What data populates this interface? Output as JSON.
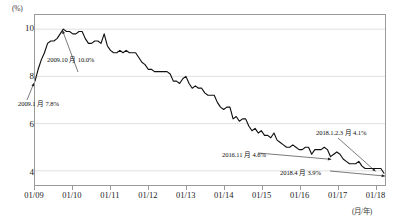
{
  "chart_data": {
    "type": "line",
    "title": "",
    "xlabel": "(月/年)",
    "ylabel": "(%)",
    "ylim": [
      3.4,
      10.6
    ],
    "yticks": [
      10,
      8,
      6,
      4
    ],
    "grid": true,
    "legend": "none",
    "xtick_labels": [
      "01/09",
      "01/10",
      "01/11",
      "01/12",
      "01/13",
      "01/14",
      "01/15",
      "01/16",
      "01/17",
      "01/18"
    ],
    "x_start": "2009-01",
    "x_end": "2018-04",
    "series": [
      {
        "name": "失業率",
        "color": "#111111",
        "x": [
          "2009-01",
          "2009-02",
          "2009-03",
          "2009-04",
          "2009-05",
          "2009-06",
          "2009-07",
          "2009-08",
          "2009-09",
          "2009-10",
          "2009-11",
          "2009-12",
          "2010-01",
          "2010-02",
          "2010-03",
          "2010-04",
          "2010-05",
          "2010-06",
          "2010-07",
          "2010-08",
          "2010-09",
          "2010-10",
          "2010-11",
          "2010-12",
          "2011-01",
          "2011-02",
          "2011-03",
          "2011-04",
          "2011-05",
          "2011-06",
          "2011-07",
          "2011-08",
          "2011-09",
          "2011-10",
          "2011-11",
          "2011-12",
          "2012-01",
          "2012-02",
          "2012-03",
          "2012-04",
          "2012-05",
          "2012-06",
          "2012-07",
          "2012-08",
          "2012-09",
          "2012-10",
          "2012-11",
          "2012-12",
          "2013-01",
          "2013-02",
          "2013-03",
          "2013-04",
          "2013-05",
          "2013-06",
          "2013-07",
          "2013-08",
          "2013-09",
          "2013-10",
          "2013-11",
          "2013-12",
          "2014-01",
          "2014-02",
          "2014-03",
          "2014-04",
          "2014-05",
          "2014-06",
          "2014-07",
          "2014-08",
          "2014-09",
          "2014-10",
          "2014-11",
          "2014-12",
          "2015-01",
          "2015-02",
          "2015-03",
          "2015-04",
          "2015-05",
          "2015-06",
          "2015-07",
          "2015-08",
          "2015-09",
          "2015-10",
          "2015-11",
          "2015-12",
          "2016-01",
          "2016-02",
          "2016-03",
          "2016-04",
          "2016-05",
          "2016-06",
          "2016-07",
          "2016-08",
          "2016-09",
          "2016-10",
          "2016-11",
          "2016-12",
          "2017-01",
          "2017-02",
          "2017-03",
          "2017-04",
          "2017-05",
          "2017-06",
          "2017-07",
          "2017-08",
          "2017-09",
          "2017-10",
          "2017-11",
          "2017-12",
          "2018-01",
          "2018-02",
          "2018-03",
          "2018-04"
        ],
        "values": [
          7.8,
          8.3,
          8.7,
          9.0,
          9.4,
          9.5,
          9.5,
          9.6,
          9.8,
          10.0,
          9.9,
          9.9,
          9.8,
          9.8,
          9.9,
          9.9,
          9.6,
          9.4,
          9.4,
          9.5,
          9.5,
          9.4,
          9.8,
          9.3,
          9.1,
          9.0,
          9.0,
          9.1,
          9.0,
          9.1,
          9.0,
          9.0,
          9.0,
          8.8,
          8.6,
          8.5,
          8.3,
          8.3,
          8.2,
          8.2,
          8.2,
          8.2,
          8.2,
          8.1,
          7.8,
          7.8,
          7.7,
          7.9,
          8.0,
          7.7,
          7.5,
          7.6,
          7.5,
          7.5,
          7.3,
          7.2,
          7.2,
          7.2,
          6.9,
          6.7,
          6.6,
          6.7,
          6.7,
          6.2,
          6.3,
          6.1,
          6.2,
          6.2,
          5.9,
          5.7,
          5.8,
          5.6,
          5.7,
          5.5,
          5.5,
          5.4,
          5.6,
          5.3,
          5.2,
          5.1,
          5.0,
          5.0,
          5.1,
          5.0,
          4.9,
          4.9,
          5.0,
          5.0,
          4.7,
          4.9,
          4.9,
          4.9,
          5.0,
          4.9,
          4.6,
          4.7,
          4.8,
          4.7,
          4.5,
          4.4,
          4.3,
          4.3,
          4.3,
          4.4,
          4.2,
          4.1,
          4.1,
          4.1,
          4.1,
          4.1,
          4.1,
          3.9
        ],
        "annotated_points": [
          {
            "label": "2009.1 月 7.8%",
            "x": "2009-01",
            "value": 7.8
          },
          {
            "label": "2009.10 月 10.0%",
            "x": "2009-10",
            "value": 10.0
          },
          {
            "label": "2016.11 月 4.6%",
            "x": "2016-11",
            "value": 4.6
          },
          {
            "label": "2018.1.2.3 月 4.1%",
            "x": "2018-01",
            "value": 4.1
          },
          {
            "label": "2018.4 月 3.9%",
            "x": "2018-04",
            "value": 3.9
          }
        ]
      }
    ]
  },
  "annotations": {
    "peak": "2009.10 月 10.0%",
    "start": "2009.1 月 7.8%",
    "mid": "2016.11 月 4.6%",
    "plateau": "2018.1.2.3 月 4.1%",
    "end": "2018.4 月 3.9%"
  },
  "axes": {
    "y_unit": "(%)",
    "x_unit": "(月/年)",
    "y_ticks": [
      "10",
      "8",
      "6",
      "4"
    ],
    "x_ticks": [
      "01/09",
      "01/10",
      "01/11",
      "01/12",
      "01/13",
      "01/14",
      "01/15",
      "01/16",
      "01/17",
      "01/18"
    ]
  },
  "colors": {
    "line": "#111111",
    "grid": "#d8d8d8",
    "frame": "#9a9a9a",
    "text": "#1a1a1a"
  }
}
